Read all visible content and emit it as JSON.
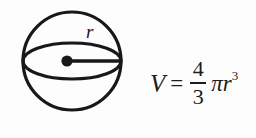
{
  "figure": {
    "kind": "geometry-figure",
    "background_color": "#fdfdfd",
    "ink_color": "#16181a"
  },
  "diagram": {
    "name": "sphere-with-radius",
    "shape_label": "sphere",
    "radius_label": "r",
    "center_marker": "filled-dot",
    "outline_circle": {
      "cx": 72,
      "cy": 61,
      "r": 58,
      "stroke_width": 3
    },
    "equator_ellipse": {
      "cx": 72,
      "cy": 61,
      "rx": 58,
      "ry": 20,
      "stroke_width": 3
    },
    "radius_segment": {
      "x1": 68,
      "y1": 61,
      "x2": 128,
      "y2": 61,
      "stroke_width": 3
    },
    "center_dot": {
      "cx": 67,
      "cy": 61,
      "r": 6
    }
  },
  "formula": {
    "variable": "V",
    "equals": "=",
    "numerator": "4",
    "denominator": "3",
    "pi": "π",
    "radius_symbol": "r",
    "exponent": "3",
    "plain_text": "V = 4/3 π r^3"
  }
}
